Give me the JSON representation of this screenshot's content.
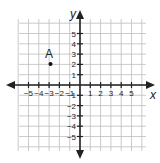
{
  "chart_data": {
    "type": "scatter",
    "title": "",
    "xlabel": "x",
    "ylabel": "y",
    "xlim": [
      -6,
      6
    ],
    "ylim": [
      -6,
      6
    ],
    "grid": true,
    "x_ticks": [
      -5,
      -4,
      -3,
      -2,
      -1,
      1,
      2,
      3,
      4,
      5
    ],
    "y_ticks": [
      5,
      4,
      3,
      2,
      1,
      -1,
      -2,
      -3,
      -4,
      -5
    ],
    "points": [
      {
        "label": "A",
        "x": -3,
        "y": 2
      }
    ]
  },
  "axes": {
    "x_label": "x",
    "y_label": "y",
    "x_tick_labels": [
      "−5",
      "−4",
      "−3",
      "−2",
      "−1",
      "1",
      "2",
      "3",
      "4",
      "5"
    ],
    "y_tick_labels": [
      "5",
      "4",
      "3",
      "2",
      "1",
      "−1",
      "−2",
      "−3",
      "−4",
      "−5"
    ]
  },
  "point_a": {
    "label": "A"
  },
  "colors": {
    "grid": "#bdbdbd",
    "axis": "#222222",
    "point": "#111111"
  }
}
